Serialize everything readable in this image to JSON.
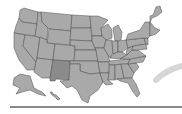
{
  "map": {
    "type": "us-states",
    "highlighted_state": "New Mexico",
    "colors": {
      "state_fill": "#a9a9a9",
      "highlight_fill": "#8b8b8b",
      "border": "#4a4a4a",
      "arc": "#d6d6d6",
      "bar": "#8a8a8a"
    }
  }
}
